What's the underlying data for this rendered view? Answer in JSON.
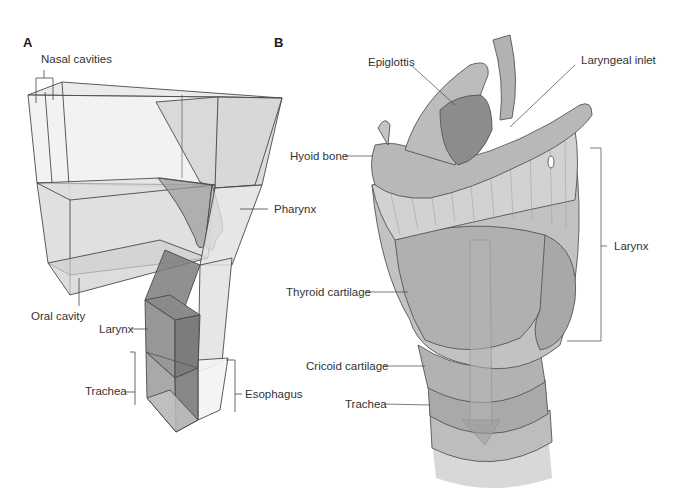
{
  "panels": {
    "a": {
      "letter": "A",
      "labels": {
        "nasal_cavities": "Nasal cavities",
        "pharynx": "Pharynx",
        "oral_cavity": "Oral cavity",
        "larynx": "Larynx",
        "trachea": "Trachea",
        "esophagus": "Esophagus"
      }
    },
    "b": {
      "letter": "B",
      "labels": {
        "epiglottis": "Epiglottis",
        "laryngeal_inlet": "Laryngeal inlet",
        "hyoid_bone": "Hyoid bone",
        "larynx": "Larynx",
        "thyroid_cartilage": "Thyroid cartilage",
        "cricoid_cartilage": "Cricoid cartilage",
        "trachea": "Trachea"
      }
    }
  },
  "colors": {
    "line": "#4a4a4a",
    "box_fill": "#d9d9d9",
    "box_dark": "#7a7a7a",
    "tissue_light": "#c8c8c8",
    "tissue_mid": "#a8a8a8",
    "tissue_dark": "#8a8a8a"
  }
}
